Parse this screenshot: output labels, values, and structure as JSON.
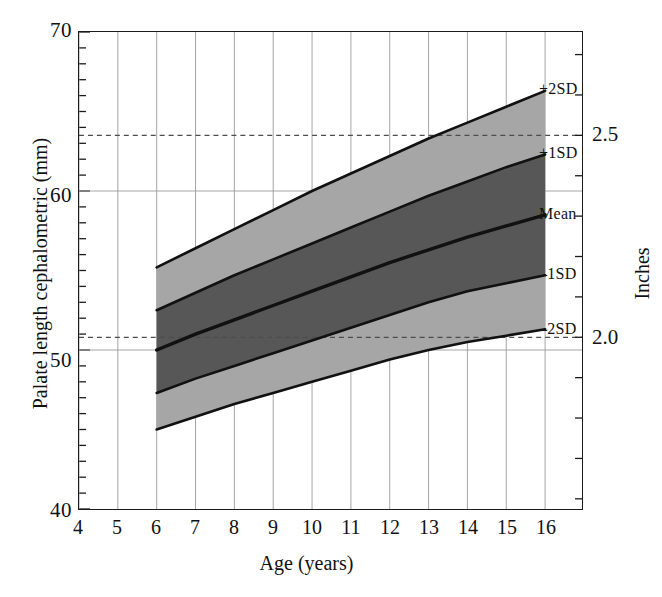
{
  "chart_data": {
    "type": "line",
    "title": "",
    "subtitle": "",
    "xlabel": "Age (years)",
    "ylabel": "Palate length cephalometric (mm)",
    "y2label": "Inches",
    "xlim": [
      4,
      16.95
    ],
    "ylim": [
      40,
      70
    ],
    "xticks": [
      4,
      5,
      6,
      7,
      8,
      9,
      10,
      11,
      12,
      13,
      14,
      15,
      16
    ],
    "yticks": [
      40,
      50,
      60,
      70
    ],
    "y_minor_tick_step": 1,
    "grid": "major x and y gridlines, light gray",
    "legend": "none; curves labelled at right end",
    "x": [
      6,
      7,
      8,
      9,
      10,
      11,
      12,
      13,
      14,
      15,
      16
    ],
    "series": [
      {
        "name": "+2SD",
        "label": "+2SD",
        "values": [
          55.2,
          56.4,
          57.6,
          58.8,
          60.0,
          61.1,
          62.2,
          63.3,
          64.3,
          65.3,
          66.3
        ]
      },
      {
        "name": "+1SD",
        "label": "+1SD",
        "values": [
          52.5,
          53.6,
          54.7,
          55.7,
          56.7,
          57.7,
          58.7,
          59.7,
          60.6,
          61.5,
          62.3
        ]
      },
      {
        "name": "Mean",
        "label": "Mean",
        "values": [
          50.0,
          51.0,
          51.9,
          52.8,
          53.7,
          54.6,
          55.5,
          56.3,
          57.1,
          57.8,
          58.5
        ]
      },
      {
        "name": "-1SD",
        "label": "–1SD",
        "values": [
          47.3,
          48.2,
          49.0,
          49.8,
          50.6,
          51.4,
          52.2,
          53.0,
          53.7,
          54.2,
          54.7
        ]
      },
      {
        "name": "-2SD",
        "label": "–2SD",
        "values": [
          45.0,
          45.8,
          46.6,
          47.3,
          48.0,
          48.7,
          49.4,
          50.0,
          50.5,
          50.9,
          51.3
        ]
      }
    ],
    "bands": [
      {
        "name": "outer-band-upper",
        "between": [
          "+1SD",
          "+2SD"
        ],
        "color": "#a6a6a6"
      },
      {
        "name": "inner-band",
        "between": [
          "-1SD",
          "+1SD"
        ],
        "color": "#575757"
      },
      {
        "name": "outer-band-lower",
        "between": [
          "-2SD",
          "-1SD"
        ],
        "color": "#a6a6a6"
      }
    ],
    "reference_lines": [
      {
        "name": "2.5 inches",
        "label": "2.5",
        "y_mm": 63.5,
        "style": "dashed"
      },
      {
        "name": "2.0 inches",
        "label": "2.0",
        "y_mm": 50.8,
        "style": "dashed"
      }
    ],
    "y2ticks": [
      {
        "label": "2.0",
        "y_mm": 50.8
      },
      {
        "label": "2.5",
        "y_mm": 63.5
      }
    ]
  },
  "axes": {
    "y_title": "Palate length cephalometric (mm)",
    "x_title": "Age (years)",
    "y2_title": "Inches",
    "y_tick_labels": [
      "70",
      "60",
      "50",
      "40"
    ],
    "x_tick_labels": [
      "4",
      "5",
      "6",
      "7",
      "8",
      "9",
      "10",
      "11",
      "12",
      "13",
      "14",
      "15",
      "16"
    ]
  },
  "curve_labels": {
    "plus2sd": "+2SD",
    "plus1sd": "+1SD",
    "mean": "Mean",
    "minus1sd": "–1SD",
    "minus2sd": "–2SD"
  },
  "inch_labels": {
    "two_five": "2.5",
    "two_zero": "2.0"
  },
  "colors": {
    "inner_band": "#575757",
    "outer_band": "#a6a6a6",
    "curve": "#111111",
    "grid": "#9a9a9a",
    "frame": "#1a1a1a",
    "dashed_reference": "#4d4d4d",
    "background": "#ffffff"
  }
}
